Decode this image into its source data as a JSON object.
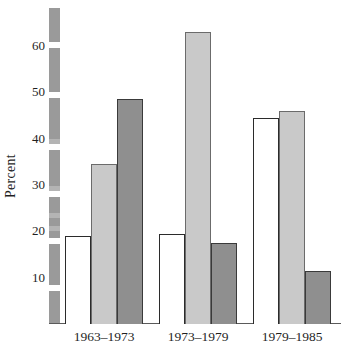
{
  "chart_data": {
    "type": "bar",
    "title": "",
    "xlabel": "",
    "ylabel": "Percent",
    "categories": [
      "1963–1973",
      "1973–1979",
      "1979–1985"
    ],
    "series": [
      {
        "name": "series-1",
        "color": "#ffffff",
        "values": [
          19,
          19.5,
          44.5
        ]
      },
      {
        "name": "series-2",
        "color": "#c9c9c9",
        "values": [
          34.5,
          63,
          46
        ]
      },
      {
        "name": "series-3",
        "color": "#8f8f8f",
        "values": [
          48.5,
          17.5,
          11.5
        ]
      }
    ],
    "ylim": [
      0,
      68
    ],
    "yticks": [
      10,
      20,
      30,
      40,
      50,
      60
    ],
    "ytick_labels": [
      "10",
      "20",
      "30",
      "40",
      "50",
      "60"
    ],
    "grid": false,
    "legend": "none",
    "axis_style": "segmented-gray-bar"
  },
  "axis": {
    "y_title": "Percent"
  },
  "colors": {
    "axis_bar": "#9a9a9a",
    "baseline": "#5a5a5a",
    "bar_white_fill": "#ffffff",
    "bar_white_edge": "#2b2b2b",
    "bar_light_fill": "#c9c9c9",
    "bar_light_edge": "#6b6b6b",
    "bar_dark_fill": "#8f8f8f",
    "bar_dark_edge": "#3a3a3a",
    "text": "#1f1f1f"
  }
}
